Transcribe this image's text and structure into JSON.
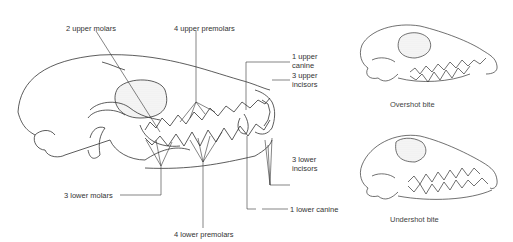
{
  "figure": {
    "main_skull": {
      "labels": {
        "upper_molars": "2 upper molars",
        "upper_premolars": "4 upper premolars",
        "upper_canine_1": "1 upper",
        "upper_canine_2": "canine",
        "upper_incisors_1": "3 upper",
        "upper_incisors_2": "incisors",
        "lower_incisors_1": "3 lower",
        "lower_incisors_2": "incisors",
        "lower_molars": "3 lower molars",
        "lower_premolars": "4 lower premolars",
        "lower_canine": "1 lower canine"
      }
    },
    "overshot": {
      "caption": "Overshot bite"
    },
    "undershot": {
      "caption": "Undershot bite"
    }
  },
  "colors": {
    "line": "#333333",
    "shade": "#d8d8d8",
    "text": "#333333"
  }
}
